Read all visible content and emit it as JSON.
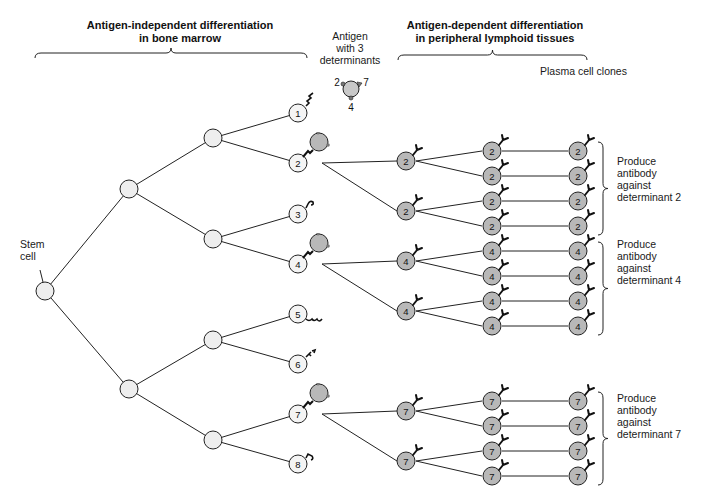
{
  "headers": {
    "left": [
      "Antigen-independent differentiation",
      "in bone marrow"
    ],
    "right": [
      "Antigen-dependent differentiation",
      "in peripheral lymphoid tissues"
    ]
  },
  "antigen": {
    "caption": [
      "Antigen",
      "with 3",
      "determinants"
    ],
    "determinants": [
      "2",
      "7",
      "4"
    ]
  },
  "stem_cell_label": [
    "Stem",
    "cell"
  ],
  "plasma_label": "Plasma cell clones",
  "colors": {
    "unstimulated_cell_fill": "#eeeeee",
    "stimulated_cell_fill": "#b8b8b8",
    "line": "#222222"
  },
  "bone_marrow_cells": [
    "1",
    "2",
    "3",
    "4",
    "5",
    "6",
    "7",
    "8"
  ],
  "activated_clones": [
    {
      "determinant": "2",
      "outcome": [
        "Produce",
        "antibody",
        "against",
        "determinant 2"
      ]
    },
    {
      "determinant": "4",
      "outcome": [
        "Produce",
        "antibody",
        "against",
        "determinant 4"
      ]
    },
    {
      "determinant": "7",
      "outcome": [
        "Produce",
        "antibody",
        "against",
        "determinant 7"
      ]
    }
  ]
}
